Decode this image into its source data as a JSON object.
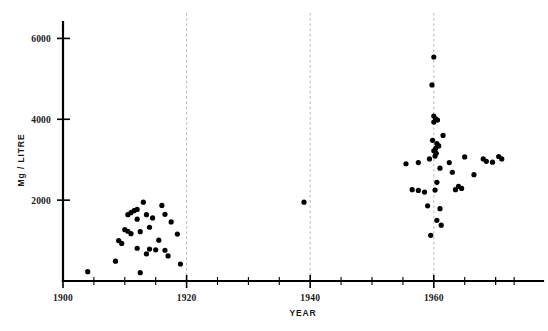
{
  "chart_data": {
    "type": "scatter",
    "title": "",
    "xlabel": "YEAR",
    "ylabel": "Mg / LITRE",
    "xlim": [
      1900,
      1974
    ],
    "ylim": [
      0,
      6200
    ],
    "grid": "vertical-dashed-at-1920-1940-1960",
    "legend": "none",
    "x_ticks_major": [
      1900,
      1920,
      1940,
      1960
    ],
    "x_tick_labels": [
      "1900",
      "1920",
      "1940",
      "1960"
    ],
    "x_ticks_minor": [
      1905,
      1910,
      1915,
      1925,
      1930,
      1935,
      1945,
      1950,
      1955,
      1965,
      1970
    ],
    "y_ticks_major": [
      2000,
      4000,
      6000
    ],
    "y_tick_labels": [
      "2000",
      "4000",
      "6000"
    ],
    "marker": "filled-circle",
    "marker_color": "#000000",
    "points": [
      [
        1904.0,
        230
      ],
      [
        1908.5,
        490
      ],
      [
        1912.5,
        205
      ],
      [
        1909.5,
        930
      ],
      [
        1911.0,
        1170
      ],
      [
        1912.0,
        1530
      ],
      [
        1913.0,
        1950
      ],
      [
        1912.0,
        1770
      ],
      [
        1911.5,
        1740
      ],
      [
        1911.0,
        1690
      ],
      [
        1910.5,
        1640
      ],
      [
        1913.5,
        1640
      ],
      [
        1914.0,
        1330
      ],
      [
        1910.0,
        1270
      ],
      [
        1910.5,
        1230
      ],
      [
        1912.5,
        1220
      ],
      [
        1914.5,
        1560
      ],
      [
        1916.0,
        1870
      ],
      [
        1916.5,
        1650
      ],
      [
        1917.5,
        1460
      ],
      [
        1918.5,
        1160
      ],
      [
        1915.5,
        1010
      ],
      [
        1914.0,
        790
      ],
      [
        1915.0,
        770
      ],
      [
        1916.5,
        760
      ],
      [
        1913.5,
        670
      ],
      [
        1912.0,
        810
      ],
      [
        1909.0,
        1000
      ],
      [
        1917.0,
        620
      ],
      [
        1919.0,
        420
      ],
      [
        1939.0,
        1950
      ],
      [
        1957.5,
        2930
      ],
      [
        1959.3,
        3020
      ],
      [
        1959.0,
        1860
      ],
      [
        1959.5,
        1130
      ],
      [
        1960.0,
        5540
      ],
      [
        1959.7,
        4850
      ],
      [
        1960.0,
        4080
      ],
      [
        1960.3,
        4010
      ],
      [
        1960.6,
        3980
      ],
      [
        1960.0,
        3930
      ],
      [
        1960.5,
        3400
      ],
      [
        1960.8,
        3340
      ],
      [
        1960.3,
        3280
      ],
      [
        1960.0,
        3220
      ],
      [
        1960.4,
        3160
      ],
      [
        1960.2,
        3090
      ],
      [
        1959.8,
        3480
      ],
      [
        1961.5,
        3600
      ],
      [
        1961.0,
        2790
      ],
      [
        1960.5,
        2440
      ],
      [
        1960.2,
        2250
      ],
      [
        1961.0,
        1790
      ],
      [
        1960.5,
        1500
      ],
      [
        1961.2,
        1380
      ],
      [
        1962.5,
        2930
      ],
      [
        1963.0,
        2690
      ],
      [
        1964.0,
        2340
      ],
      [
        1963.5,
        2260
      ],
      [
        1964.5,
        2290
      ],
      [
        1965.0,
        3070
      ],
      [
        1966.5,
        2630
      ],
      [
        1968.0,
        3020
      ],
      [
        1968.5,
        2960
      ],
      [
        1969.5,
        2940
      ],
      [
        1970.5,
        3080
      ],
      [
        1971.0,
        3020
      ],
      [
        1955.5,
        2900
      ],
      [
        1956.5,
        2260
      ],
      [
        1957.5,
        2240
      ],
      [
        1958.5,
        2200
      ]
    ]
  },
  "axes": {
    "y_axis_title": "Mg / LITRE",
    "x_axis_title": "YEAR"
  }
}
